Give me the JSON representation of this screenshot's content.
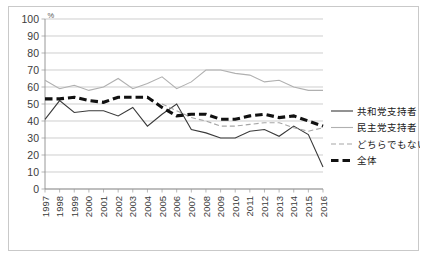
{
  "chart_data": {
    "type": "line",
    "title": "",
    "xlabel": "",
    "ylabel": "%",
    "unit_label": "%",
    "ylim": [
      0,
      100
    ],
    "ytick_step": 10,
    "yticks": [
      "0",
      "10",
      "20",
      "30",
      "40",
      "50",
      "60",
      "70",
      "80",
      "90",
      "100"
    ],
    "grid": true,
    "legend_position": "right",
    "categories": [
      "1997",
      "1998",
      "1999",
      "2000",
      "2001",
      "2002",
      "2003",
      "2004",
      "2005",
      "2006",
      "2007",
      "2008",
      "2009",
      "2010",
      "2011",
      "2012",
      "2013",
      "2014",
      "2015",
      "2016"
    ],
    "series": [
      {
        "name": "共和党支持者",
        "style": "solid-dark",
        "color": "#3a3a3a",
        "values": [
          41,
          52,
          45,
          46,
          46,
          43,
          48,
          37,
          44,
          50,
          35,
          33,
          30,
          30,
          34,
          35,
          31,
          37,
          32,
          13
        ]
      },
      {
        "name": "民主党支持者",
        "style": "solid-gray",
        "color": "#b0b0b0",
        "values": [
          64,
          59,
          61,
          58,
          60,
          65,
          59,
          62,
          66,
          59,
          63,
          70,
          70,
          68,
          67,
          63,
          64,
          60,
          58,
          58
        ]
      },
      {
        "name": "どちらでもない",
        "style": "dashed-gray",
        "color": "#a6a6a6",
        "values": [
          null,
          null,
          null,
          null,
          null,
          null,
          null,
          null,
          50,
          46,
          42,
          40,
          37,
          37,
          38,
          39,
          39,
          36,
          34,
          36
        ]
      },
      {
        "name": "全体",
        "style": "dashed-bold-black",
        "color": "#111111",
        "values": [
          53,
          53,
          54,
          52,
          51,
          54,
          54,
          54,
          48,
          43,
          44,
          44,
          41,
          41,
          43,
          44,
          42,
          43,
          40,
          37
        ]
      }
    ]
  },
  "legend": {
    "items": [
      {
        "label": "共和党支持者"
      },
      {
        "label": "民主党支持者"
      },
      {
        "label": "どちらでもない"
      },
      {
        "label": "全体"
      }
    ]
  }
}
